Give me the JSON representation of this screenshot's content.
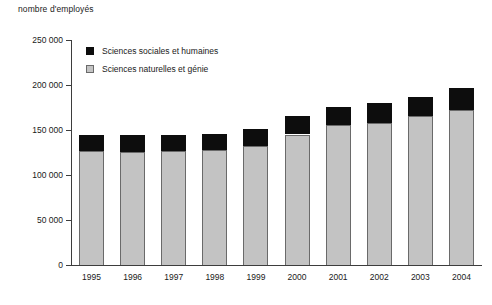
{
  "chart_data": {
    "type": "bar",
    "stacked": true,
    "title": "",
    "ylabel": "nombre d'employés",
    "xlabel": "",
    "categories": [
      "1995",
      "1996",
      "1997",
      "1998",
      "1999",
      "2000",
      "2001",
      "2002",
      "2003",
      "2004"
    ],
    "series": [
      {
        "name": "Sciences naturelles et génie",
        "color": "#c3c3c3",
        "values": [
          127000,
          126000,
          127000,
          128000,
          132500,
          145000,
          156000,
          158000,
          166000,
          172000
        ]
      },
      {
        "name": "Sciences sociales et humaines",
        "color": "#0d0d0d",
        "values": [
          18000,
          19000,
          18000,
          18000,
          19000,
          21000,
          20000,
          22000,
          21000,
          25000
        ]
      }
    ],
    "totals": [
      145000,
      145000,
      145000,
      146000,
      151500,
      166000,
      176000,
      180000,
      187000,
      197000
    ],
    "ylim": [
      0,
      250000
    ],
    "yticks": [
      0,
      50000,
      100000,
      150000,
      200000,
      250000
    ],
    "ytick_labels": [
      "0",
      "50 000",
      "100 000",
      "150 000",
      "200 000",
      "250 000"
    ],
    "grid": false,
    "legend_position": "top-left",
    "legend_entries": [
      "Sciences sociales et humaines",
      "Sciences naturelles et génie"
    ]
  }
}
